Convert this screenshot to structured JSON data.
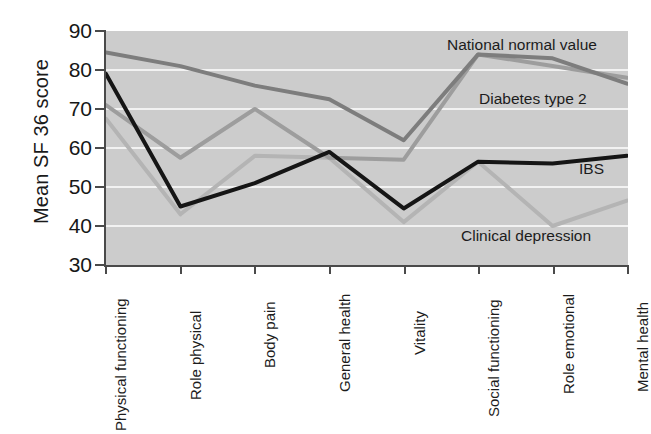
{
  "chart_data": {
    "type": "line",
    "title": "",
    "xlabel": "",
    "ylabel": "Mean SF 36 score",
    "ylim": [
      30,
      90
    ],
    "yticks": [
      30,
      40,
      50,
      60,
      70,
      80,
      90
    ],
    "grid": true,
    "grid_orientation": "horizontal",
    "legend_position": "inline-annotations",
    "background": "#cccccc",
    "categories": [
      "Physical functioning",
      "Role physical",
      "Body pain",
      "General health",
      "Vitality",
      "Social functioning",
      "Role emotional",
      "Mental health"
    ],
    "series": [
      {
        "name": "National normal value",
        "color": "#7d7d7d",
        "values": [
          84.5,
          81,
          76,
          72.5,
          62,
          84,
          83,
          76.5
        ]
      },
      {
        "name": "Diabetes type 2",
        "color": "#9d9d9d",
        "values": [
          71,
          57.5,
          70,
          57.5,
          57,
          84,
          81,
          78
        ]
      },
      {
        "name": "IBS",
        "color": "#151515",
        "values": [
          79,
          45,
          51,
          59,
          44.5,
          56.5,
          56,
          58
        ]
      },
      {
        "name": "Clinical depression",
        "color": "#b4b4b4",
        "values": [
          67.5,
          43,
          58,
          57.5,
          41,
          56.5,
          40,
          46.5
        ]
      }
    ],
    "annotations": [
      {
        "text": "National normal value",
        "series": "National normal value"
      },
      {
        "text": "Diabetes type 2",
        "series": "Diabetes type 2"
      },
      {
        "text": "IBS",
        "series": "IBS"
      },
      {
        "text": "Clinical depression",
        "series": "Clinical depression"
      }
    ]
  },
  "axis": {
    "y_title": "Mean SF 36 score",
    "y_tick_labels": [
      "90",
      "80",
      "70",
      "60",
      "50",
      "40",
      "30"
    ]
  },
  "colors": {
    "plot_background": "#cccccc",
    "gridline": "#f2f2f2",
    "axis": "#4a4a4a",
    "text": "#1c1c1c"
  }
}
